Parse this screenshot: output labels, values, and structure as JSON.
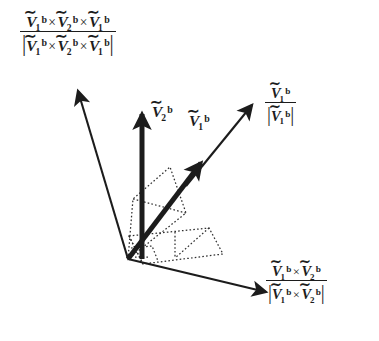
{
  "figure": {
    "name": "orthonormal-basis-vector-diagram",
    "background_color": "#ffffff",
    "stroke_color": "#1c1c1c",
    "dotted_color": "#3a3a3a"
  },
  "labels": {
    "normal_axis": {
      "name": "normalized-triple-cross-product",
      "numerator": {
        "term1": {
          "symbol": "V",
          "accent": "tilde",
          "sub": "1",
          "sup": "b"
        },
        "op1": "×",
        "term2": {
          "symbol": "V",
          "accent": "tilde",
          "sub": "2",
          "sup": "b"
        },
        "op2": "×",
        "term3": {
          "symbol": "V",
          "accent": "tilde",
          "sub": "1",
          "sup": "b"
        }
      },
      "denominator_is_magnitude": true,
      "plain_text": "(Ṽ1^b × Ṽ2^b × Ṽ1^b) / |Ṽ1^b × Ṽ2^b × Ṽ1^b|"
    },
    "v2_vector": {
      "name": "v2-b-vector-label",
      "symbol": "V",
      "accent": "tilde",
      "sub": "2",
      "sup": "b",
      "plain_text": "Ṽ2^b"
    },
    "v1_vector": {
      "name": "v1-b-vector-label",
      "symbol": "V",
      "accent": "tilde",
      "sub": "1",
      "sup": "b",
      "plain_text": "Ṽ1^b"
    },
    "v1_unit": {
      "name": "v1-b-unit-vector-label",
      "numerator": {
        "symbol": "V",
        "accent": "tilde",
        "sub": "1",
        "sup": "b"
      },
      "denominator_is_magnitude": true,
      "plain_text": "Ṽ1^b / |Ṽ1^b|"
    },
    "binormal_axis": {
      "name": "normalized-cross-product-v1-v2",
      "numerator": {
        "term1": {
          "symbol": "V",
          "accent": "tilde",
          "sub": "1",
          "sup": "b"
        },
        "op1": "×",
        "term2": {
          "symbol": "V",
          "accent": "tilde",
          "sub": "2",
          "sup": "b"
        }
      },
      "denominator_is_magnitude": true,
      "plain_text": "(Ṽ1^b × Ṽ2^b) / |Ṽ1^b × Ṽ2^b|"
    }
  },
  "glyphs": {
    "tilde": "∼",
    "times": "×",
    "vbar": "|"
  },
  "geometry": {
    "origin": {
      "x": 128,
      "y": 259
    },
    "arrows": [
      {
        "name": "arrow-normal-axis",
        "x1": 128,
        "y1": 259,
        "x2": 76,
        "y2": 86,
        "width": 2.2,
        "head": 10
      },
      {
        "name": "arrow-v2-b",
        "x1": 142,
        "y1": 259,
        "x2": 142,
        "y2": 106,
        "width": 5.0,
        "head": 14
      },
      {
        "name": "arrow-v1-b",
        "x1": 128,
        "y1": 259,
        "x2": 207,
        "y2": 156,
        "width": 5.0,
        "head": 14
      },
      {
        "name": "arrow-v1-unit",
        "x1": 185,
        "y1": 185,
        "x2": 256,
        "y2": 100,
        "width": 2.2,
        "head": 10
      },
      {
        "name": "arrow-binormal-axis",
        "x1": 128,
        "y1": 259,
        "x2": 273,
        "y2": 294,
        "width": 2.4,
        "head": 11
      }
    ]
  }
}
